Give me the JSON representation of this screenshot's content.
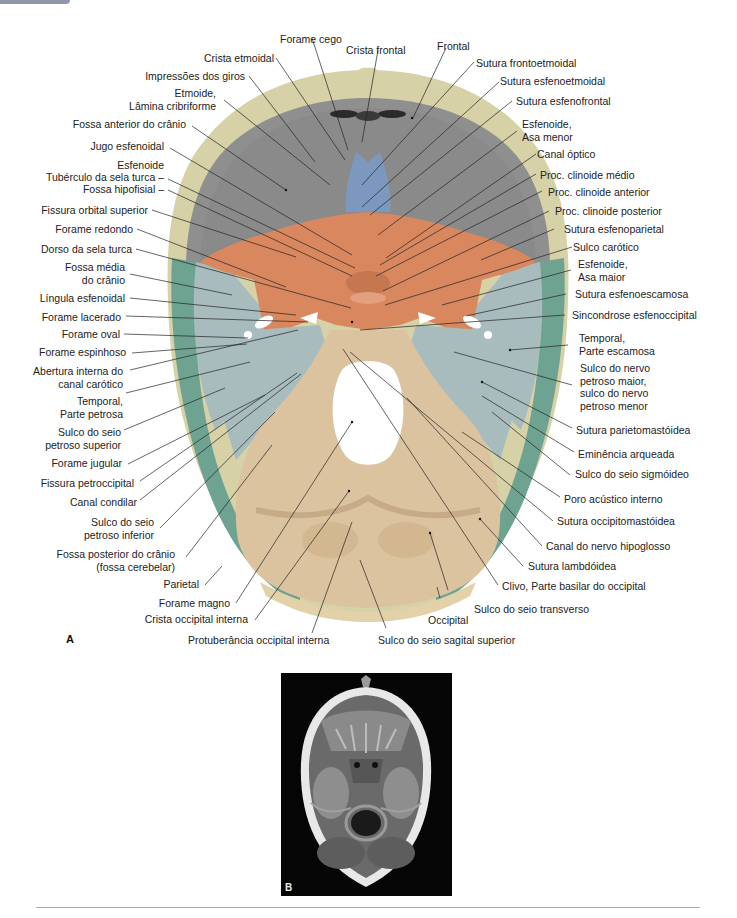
{
  "figure": {
    "panel_a_letter": "A",
    "panel_b_letter": "B",
    "colors": {
      "frontal_bone": "#d6d1a6",
      "cranial_floor_gray": "#8f8f8f",
      "ethmoid_blue": "#7d98bf",
      "sphenoid_orange": "#d9875f",
      "temporal_blue_gray": "#a9bcbd",
      "parietal_green": "#6fa391",
      "occipital_tan": "#dcc3a0",
      "rule_line": "#b9a4a8"
    },
    "labels_top": [
      {
        "id": "forame-cego",
        "text": "Forame cego"
      },
      {
        "id": "crista-etmoidal",
        "text": "Crista etmoidal"
      },
      {
        "id": "crista-frontal",
        "text": "Crista frontal"
      },
      {
        "id": "frontal",
        "text": "Frontal"
      }
    ],
    "labels_left": [
      {
        "id": "impressoes-dos-giros",
        "text": "Impressões dos giros"
      },
      {
        "id": "etmoide-lamina",
        "lines": [
          "Etmoide,",
          "Lâmina cribriforme"
        ]
      },
      {
        "id": "fossa-anterior",
        "text": "Fossa anterior do crânio"
      },
      {
        "id": "jugo-esfenoidal",
        "text": "Jugo esfenoidal"
      },
      {
        "id": "esfenoide-head",
        "text": "Esfenoide"
      },
      {
        "id": "tuberculo-sela",
        "text": "Tubérculo da sela turca –"
      },
      {
        "id": "fossa-hipofisial",
        "text": "Fossa hipofisial –"
      },
      {
        "id": "fissura-orbital-superior",
        "text": "Fissura orbital superior"
      },
      {
        "id": "forame-redondo",
        "text": "Forame redondo"
      },
      {
        "id": "dorso-sela",
        "text": "Dorso da sela turca"
      },
      {
        "id": "fossa-media",
        "lines": [
          "Fossa média",
          "do crânio"
        ]
      },
      {
        "id": "lingula-esfenoidal",
        "text": "Língula esfenoidal"
      },
      {
        "id": "forame-lacerado",
        "text": "Forame lacerado"
      },
      {
        "id": "forame-oval",
        "text": "Forame oval"
      },
      {
        "id": "forame-espinhoso",
        "text": "Forame espinhoso"
      },
      {
        "id": "abertura-canal-carotico",
        "lines": [
          "Abertura interna do",
          "canal carótico"
        ]
      },
      {
        "id": "temporal-petrosa",
        "lines": [
          "Temporal,",
          "Parte petrosa"
        ]
      },
      {
        "id": "sulco-petroso-superior",
        "lines": [
          "Sulco do seio",
          "petroso superior"
        ]
      },
      {
        "id": "forame-jugular",
        "text": "Forame jugular"
      },
      {
        "id": "fissura-petroccipital",
        "text": "Fissura petroccipital"
      },
      {
        "id": "canal-condilar",
        "text": "Canal condilar"
      },
      {
        "id": "sulco-petroso-inferior",
        "lines": [
          "Sulco do seio",
          "petroso inferior"
        ]
      },
      {
        "id": "fossa-posterior",
        "lines": [
          "Fossa posterior do crânio",
          "(fossa cerebelar)"
        ]
      },
      {
        "id": "parietal",
        "text": "Parietal"
      },
      {
        "id": "forame-magno",
        "text": "Forame magno"
      },
      {
        "id": "crista-occipital-interna",
        "text": "Crista occipital interna"
      }
    ],
    "labels_right": [
      {
        "id": "sutura-frontoetmoidal",
        "text": "Sutura frontoetmoidal"
      },
      {
        "id": "sutura-esfenoetmoidal",
        "text": "Sutura esfenoetmoidal"
      },
      {
        "id": "sutura-esfenofrontal",
        "text": "Sutura esfenofrontal"
      },
      {
        "id": "esfenoide-asa-menor",
        "lines": [
          "Esfenoide,",
          "Asa menor"
        ]
      },
      {
        "id": "canal-optico",
        "text": "Canal óptico"
      },
      {
        "id": "clinoide-medio",
        "text": "Proc. clinoide médio"
      },
      {
        "id": "clinoide-anterior",
        "text": "Proc. clinoide anterior"
      },
      {
        "id": "clinoide-posterior",
        "text": "Proc. clinoide posterior"
      },
      {
        "id": "sutura-esfenoparietal",
        "text": "Sutura esfenoparietal"
      },
      {
        "id": "sulco-carotico",
        "text": "Sulco carótico"
      },
      {
        "id": "esfenoide-asa-maior",
        "lines": [
          "Esfenoide,",
          "Asa maior"
        ]
      },
      {
        "id": "sutura-esfenoescamosa",
        "text": "Sutura esfenoescamosa"
      },
      {
        "id": "sincondrose-esfenoccipital",
        "text": "Sincondrose esfenoccipital"
      },
      {
        "id": "temporal-escamosa",
        "lines": [
          "Temporal,",
          "Parte escamosa"
        ]
      },
      {
        "id": "sulco-nervo-petroso",
        "lines": [
          "Sulco do nervo",
          "petroso maior,",
          "sulco do nervo",
          "petroso menor"
        ]
      },
      {
        "id": "sutura-parietomastoidea",
        "text": "Sutura parietomastóidea"
      },
      {
        "id": "eminencia-arqueada",
        "text": "Eminência arqueada"
      },
      {
        "id": "sulco-sigmoideo",
        "text": "Sulco do seio sigmóideo"
      },
      {
        "id": "poro-acustico",
        "text": "Poro acústico interno"
      },
      {
        "id": "sutura-occipitomastoidea",
        "text": "Sutura occipitomastóidea"
      },
      {
        "id": "canal-hipoglosso",
        "text": "Canal do nervo hipoglosso"
      },
      {
        "id": "sutura-lambdoidea",
        "text": "Sutura lambdóidea"
      },
      {
        "id": "clivo",
        "text": "Clivo, Parte basilar do occipital"
      },
      {
        "id": "sulco-transverso",
        "text": "Sulco do seio transverso"
      },
      {
        "id": "occipital",
        "text": "Occipital"
      }
    ],
    "labels_bottom": [
      {
        "id": "protuberancia-occipital",
        "text": "Protuberância occipital interna"
      },
      {
        "id": "sulco-sagital-superior",
        "text": "Sulco do seio sagital superior"
      }
    ]
  }
}
